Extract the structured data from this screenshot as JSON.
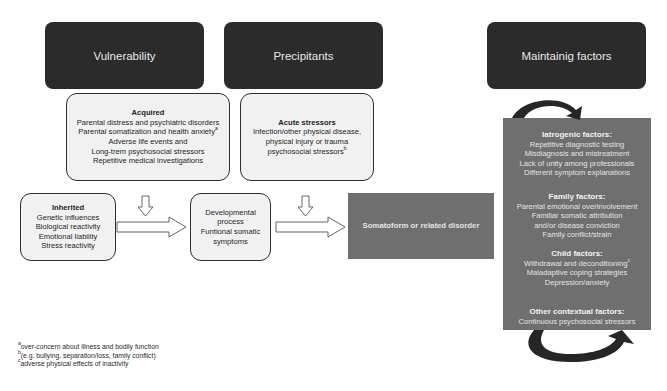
{
  "headers": {
    "vulnerability": "Vulnerability",
    "precipitants": "Precipitants",
    "maintaining": "Maintainig factors"
  },
  "acquired": {
    "title": "Acquired",
    "lines": [
      "Parental distress and psychiatric disorders",
      "Parental somatization and health anxiety",
      "Adverse life events and",
      "Long-trem psychosocial stressors",
      "Repetitive medical investigations"
    ],
    "sup": "a"
  },
  "acute": {
    "title": "Acute stressors",
    "lines": [
      "Infection/other physical disease,",
      "physical injury or trauma",
      "psychosocial stressors"
    ],
    "sup": "b"
  },
  "inherited": {
    "title": "Inherited",
    "lines": [
      "Genetic influences",
      "Biological reactivity",
      "Emotional liability",
      "Stress reactivity"
    ]
  },
  "developmental": {
    "lines": [
      "Developmental",
      "process",
      "Funtional somatic",
      "symptoms"
    ]
  },
  "disorder": {
    "label": "Somatoform or related disorder"
  },
  "maintaining_panel": {
    "iatrogenic": {
      "title": "Iatrogenic factors:",
      "lines": [
        "Repetitive diagnostic testing",
        "Misdiagnosis and mistreatment",
        "Lack of unity among professionals",
        "Different symptom explanations"
      ]
    },
    "family": {
      "title": "Family factors:",
      "lines": [
        "Parental emotional overinvolvement",
        "Familiar somatic attribution",
        "and/or disease conviction",
        "Family conflict/strain"
      ]
    },
    "child": {
      "title": "Child factors:",
      "lines": [
        "Withdrawal and deconditioning",
        "Maladaptive coping strategies",
        "Depression/anxiety"
      ],
      "sup": "c"
    },
    "other": {
      "title": "Other contextual factors:",
      "lines": [
        "Continuous psychosocial stressors"
      ]
    }
  },
  "footnotes": [
    {
      "mark": "a",
      "text": "over-concern about illness and bodily function"
    },
    {
      "mark": "b",
      "text": "(e.g. bullying, separation/loss, family conflict)"
    },
    {
      "mark": "c",
      "text": "adverse physical effects of inactivity"
    }
  ],
  "colors": {
    "header": "#2b2b2b",
    "box": "#f1f1f1",
    "grey_panel": "#6f6f6f"
  }
}
